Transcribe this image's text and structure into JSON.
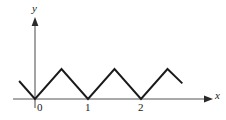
{
  "figure": {
    "axes": {
      "y_label": "y",
      "x_label": "x"
    },
    "tick_labels": {
      "origin": "0",
      "one": "1",
      "two": "2"
    },
    "colors": {
      "axis": "#8c8c8c",
      "curve": "#1a1a1a",
      "arrow": "#2a2a2a",
      "background": "#ffffff"
    }
  },
  "chart_data": {
    "type": "line",
    "title": "",
    "subtitle": "",
    "xlabel": "x",
    "ylabel": "y",
    "grid": false,
    "legend": null,
    "xlim": [
      -0.42,
      3.35
    ],
    "ylim": [
      0,
      1.62
    ],
    "x_ticks": [
      0,
      1,
      2
    ],
    "x_tick_labels": [
      "0",
      "1",
      "2"
    ],
    "y_ticks": [],
    "y_tick_labels": [],
    "series": [
      {
        "name": "triangular wave",
        "x": [
          -0.3,
          0.0,
          0.5,
          1.0,
          1.5,
          2.0,
          2.5,
          2.78
        ],
        "y": [
          0.6,
          0.0,
          1.0,
          0.0,
          1.0,
          0.0,
          1.0,
          0.52
        ]
      }
    ],
    "annotations": [
      {
        "text": "y",
        "x": -0.04,
        "y": 1.58,
        "role": "axis-name"
      },
      {
        "text": "x",
        "x": 3.4,
        "y": 0.12,
        "role": "axis-name"
      },
      {
        "text": "0",
        "x": 0.06,
        "y": -0.13,
        "role": "tick"
      },
      {
        "text": "1",
        "x": 0.99,
        "y": -0.13,
        "role": "tick"
      },
      {
        "text": "2",
        "x": 1.99,
        "y": -0.13,
        "role": "tick"
      }
    ]
  }
}
